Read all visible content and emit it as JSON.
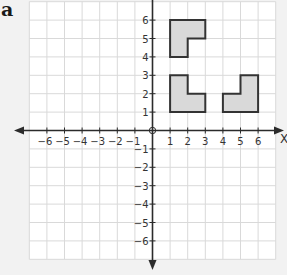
{
  "figure_label": "a",
  "grid": {
    "x_range": [
      -7,
      7
    ],
    "y_range": [
      -7,
      7
    ],
    "x_ticks": [
      -6,
      -5,
      -4,
      -3,
      -2,
      -1,
      1,
      2,
      3,
      4,
      5,
      6
    ],
    "y_ticks": [
      6,
      5,
      4,
      3,
      2,
      1,
      -1,
      -2,
      -3,
      -4,
      -5,
      -6
    ],
    "origin_label": "0",
    "x_axis_label": "x",
    "grid_color": "#d9d9d9",
    "plot_bg": "#ffffff",
    "axis_color": "#2b2b2b"
  },
  "shapes": [
    {
      "name": "shape-upper",
      "fill": "#d9d9d9",
      "stroke": "#333333",
      "points": [
        [
          1,
          6
        ],
        [
          3,
          6
        ],
        [
          3,
          5
        ],
        [
          2,
          5
        ],
        [
          2,
          4
        ],
        [
          1,
          4
        ]
      ]
    },
    {
      "name": "shape-lower-left",
      "fill": "#d9d9d9",
      "stroke": "#333333",
      "points": [
        [
          1,
          3
        ],
        [
          2,
          3
        ],
        [
          2,
          2
        ],
        [
          3,
          2
        ],
        [
          3,
          1
        ],
        [
          1,
          1
        ]
      ]
    },
    {
      "name": "shape-lower-right",
      "fill": "#d9d9d9",
      "stroke": "#333333",
      "points": [
        [
          4,
          2
        ],
        [
          5,
          2
        ],
        [
          5,
          3
        ],
        [
          6,
          3
        ],
        [
          6,
          1
        ],
        [
          4,
          1
        ]
      ]
    }
  ]
}
